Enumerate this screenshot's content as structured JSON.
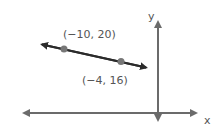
{
  "diagram": {
    "type": "coordinate-plane-line",
    "axes": {
      "x_label": "x",
      "y_label": "y"
    },
    "points": [
      {
        "label": "(−10, 20)",
        "x": -10,
        "y": 20
      },
      {
        "label": "(−4, 16)",
        "x": -4,
        "y": 16
      }
    ],
    "colors": {
      "axis": "#6b6b6b",
      "line": "#2b2b2b",
      "point": "#777777",
      "text": "#555555"
    }
  }
}
